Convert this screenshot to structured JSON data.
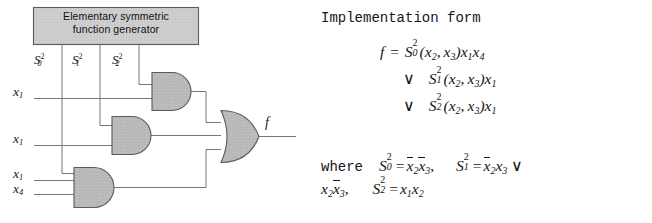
{
  "circuit": {
    "block_label_line1": "Elementary symmetric",
    "block_label_line2": "function generator",
    "signals": [
      {
        "name": "S0_2",
        "base": "S",
        "sub": "0",
        "sup": "2"
      },
      {
        "name": "S1_2",
        "base": "S",
        "sub": "1",
        "sup": "2"
      },
      {
        "name": "S2_2",
        "base": "S",
        "sub": "2",
        "sup": "2"
      }
    ],
    "inputs": [
      {
        "name": "x1-top",
        "base": "x",
        "sub": "1"
      },
      {
        "name": "x1-mid",
        "base": "x",
        "sub": "1"
      },
      {
        "name": "x1-low",
        "base": "x",
        "sub": "1"
      },
      {
        "name": "x4",
        "base": "x",
        "sub": "4"
      }
    ],
    "output_label": "f",
    "gates": [
      {
        "name": "and-gate-top",
        "type": "AND"
      },
      {
        "name": "and-gate-middle",
        "type": "AND"
      },
      {
        "name": "and-gate-bottom",
        "type": "AND"
      },
      {
        "name": "or-gate",
        "type": "OR"
      }
    ],
    "colors": {
      "gate_fill": "#b8b8b8",
      "block_fill": "#c9c9c9",
      "stroke": "#4a4a4a",
      "wire": "#6b6b6b"
    }
  },
  "formula": {
    "heading": "Implementation form",
    "where_word": "where",
    "eq_line1": {
      "lhs": "f",
      "eq": "=",
      "S_base": "S",
      "S_sub": "0",
      "S_sup": "2",
      "args": "(x2, x3)",
      "tail": "x1x4"
    },
    "eq_line2": {
      "vee": "∨",
      "S_base": "S",
      "S_sub": "1",
      "S_sup": "2",
      "args": "(x2, x3)",
      "tail": "x1"
    },
    "eq_line3": {
      "vee": "∨",
      "S_base": "S",
      "S_sub": "2",
      "S_sup": "2",
      "args": "(x2, x3)",
      "tail": "x1"
    },
    "where_defs": {
      "def0": "S0^2 = ̅x2̅x3,",
      "def1": "S1^2 = ̅x2 x3 ∨ x2 ̅x3,",
      "def2": "S2^2 = x1 x2"
    },
    "plain_text": "f = S0^2(x2,x3)x1x4 ∨ S1^2(x2,x3)x1 ∨ S2^2(x2,x3)x1 where S0^2 = x2'x3', S1^2 = x2'x3 ∨ x2x3', S2^2 = x1x2"
  }
}
